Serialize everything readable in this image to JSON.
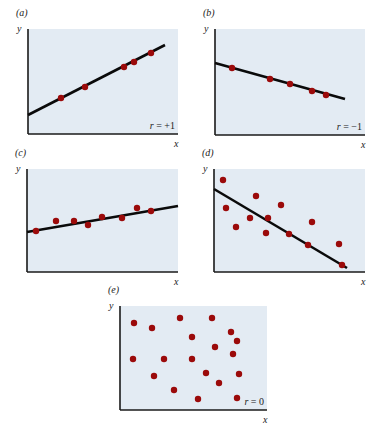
{
  "colors": {
    "plot_bg": "#e3ebf3",
    "dot": "#9b0a0a",
    "line": "#0a0a0a",
    "axis": "#1a1a1a"
  },
  "chart_data": [
    {
      "type": "scatter",
      "panel": "(a)",
      "title": "(a)",
      "xlabel": "x",
      "ylabel": "y",
      "annotation": "r = +1",
      "fit_line": true,
      "grid": false,
      "points_px": [
        [
          61,
          98
        ],
        [
          85,
          87
        ],
        [
          124,
          67
        ],
        [
          134,
          62
        ],
        [
          151,
          53
        ]
      ],
      "line_px": [
        [
          28,
          115
        ],
        [
          165,
          45
        ]
      ],
      "frame_px": {
        "left": 28,
        "top": 29,
        "right": 178,
        "bottom": 134
      }
    },
    {
      "type": "scatter",
      "panel": "(b)",
      "title": "(b)",
      "xlabel": "x",
      "ylabel": "y",
      "annotation": "r = −1",
      "fit_line": true,
      "grid": false,
      "points_px": [
        [
          232,
          68
        ],
        [
          270,
          79
        ],
        [
          290,
          84
        ],
        [
          312,
          91
        ],
        [
          326,
          95
        ]
      ],
      "line_px": [
        [
          215,
          63
        ],
        [
          345,
          99
        ]
      ],
      "frame_px": {
        "left": 215,
        "top": 29,
        "right": 365,
        "bottom": 135
      }
    },
    {
      "type": "scatter",
      "panel": "(c)",
      "title": "(c)",
      "xlabel": "x",
      "ylabel": "y",
      "annotation": "",
      "fit_line": true,
      "grid": false,
      "points_px": [
        [
          36,
          231
        ],
        [
          56,
          221
        ],
        [
          74,
          221
        ],
        [
          88,
          225
        ],
        [
          102,
          217
        ],
        [
          122,
          218
        ],
        [
          137,
          208
        ],
        [
          151,
          211
        ]
      ],
      "line_px": [
        [
          27,
          232
        ],
        [
          178,
          206
        ]
      ],
      "frame_px": {
        "left": 27,
        "top": 169,
        "right": 178,
        "bottom": 272
      }
    },
    {
      "type": "scatter",
      "panel": "(d)",
      "title": "(d)",
      "xlabel": "x",
      "ylabel": "y",
      "annotation": "",
      "fit_line": true,
      "grid": false,
      "points_px": [
        [
          223,
          180
        ],
        [
          226,
          208
        ],
        [
          236,
          227
        ],
        [
          250,
          218
        ],
        [
          256,
          196
        ],
        [
          268,
          218
        ],
        [
          266,
          233
        ],
        [
          281,
          205
        ],
        [
          289,
          234
        ],
        [
          312,
          222
        ],
        [
          308,
          245
        ],
        [
          339,
          244
        ],
        [
          342,
          265
        ]
      ],
      "line_px": [
        [
          214,
          189
        ],
        [
          347,
          268
        ]
      ],
      "frame_px": {
        "left": 214,
        "top": 169,
        "right": 365,
        "bottom": 272
      }
    },
    {
      "type": "scatter",
      "panel": "(e)",
      "title": "(e)",
      "xlabel": "x",
      "ylabel": "y",
      "annotation": "r = 0",
      "fit_line": false,
      "grid": false,
      "points_px": [
        [
          134,
          323
        ],
        [
          152,
          328
        ],
        [
          180,
          318
        ],
        [
          212,
          318
        ],
        [
          192,
          337
        ],
        [
          231,
          332
        ],
        [
          237,
          341
        ],
        [
          215,
          347
        ],
        [
          233,
          354
        ],
        [
          133,
          359
        ],
        [
          164,
          359
        ],
        [
          192,
          359
        ],
        [
          206,
          373
        ],
        [
          239,
          374
        ],
        [
          154,
          376
        ],
        [
          219,
          383
        ],
        [
          174,
          390
        ],
        [
          198,
          399
        ],
        [
          237,
          398
        ]
      ],
      "line_px": null,
      "frame_px": {
        "left": 120,
        "top": 306,
        "right": 267,
        "bottom": 410
      }
    }
  ]
}
